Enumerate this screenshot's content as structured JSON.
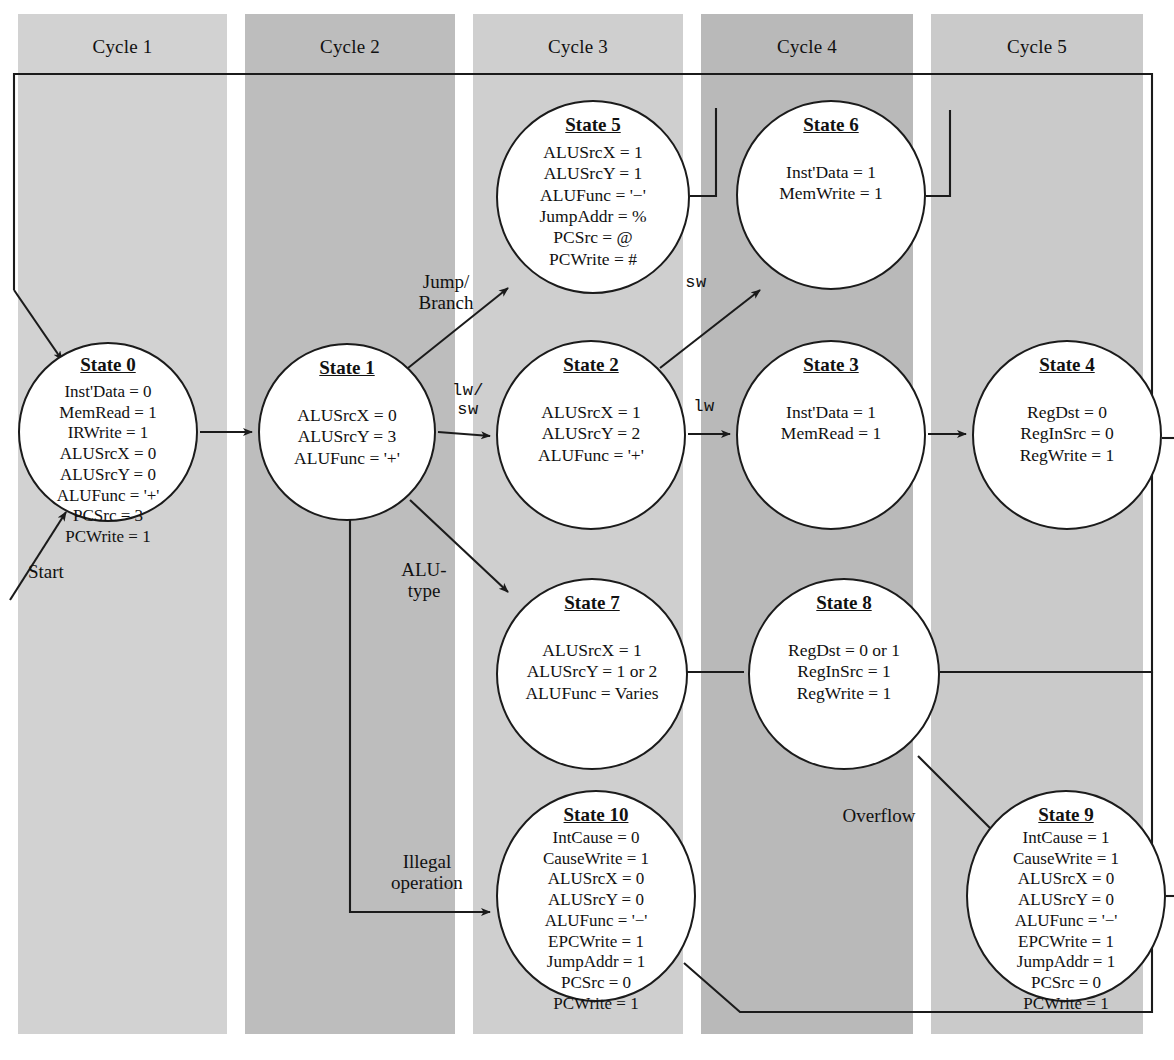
{
  "figure": {
    "kind": "finite-state-machine-diagram"
  },
  "cycles": [
    {
      "label": "Cycle 1",
      "color": "#d2d2d2"
    },
    {
      "label": "Cycle 2",
      "color": "#bdbdbd"
    },
    {
      "label": "Cycle 3",
      "color": "#cfcfcf"
    },
    {
      "label": "Cycle 4",
      "color": "#b9b9b9"
    },
    {
      "label": "Cycle 5",
      "color": "#cacaca"
    }
  ],
  "states": [
    {
      "id": "state-0",
      "title": "State 0",
      "signals": [
        "Inst'Data = 0",
        "MemRead = 1",
        "IRWrite = 1",
        "ALUSrcX = 0",
        "ALUSrcY = 0",
        "ALUFunc = '+'",
        "PCSrc = 3",
        "PCWrite = 1"
      ]
    },
    {
      "id": "state-1",
      "title": "State 1",
      "signals": [
        "ALUSrcX = 0",
        "ALUSrcY = 3",
        "ALUFunc = '+'"
      ]
    },
    {
      "id": "state-5",
      "title": "State 5",
      "signals": [
        "ALUSrcX = 1",
        "ALUSrcY = 1",
        "ALUFunc = '−'",
        "JumpAddr = %",
        "PCSrc = @",
        "PCWrite = #"
      ]
    },
    {
      "id": "state-6",
      "title": "State 6",
      "signals": [
        "Inst'Data = 1",
        "MemWrite = 1"
      ]
    },
    {
      "id": "state-2",
      "title": "State 2",
      "signals": [
        "ALUSrcX = 1",
        "ALUSrcY = 2",
        "ALUFunc = '+'"
      ]
    },
    {
      "id": "state-3",
      "title": "State 3",
      "signals": [
        "Inst'Data = 1",
        "MemRead = 1"
      ]
    },
    {
      "id": "state-4",
      "title": "State 4",
      "signals": [
        "RegDst = 0",
        "RegInSrc = 0",
        "RegWrite = 1"
      ]
    },
    {
      "id": "state-7",
      "title": "State 7",
      "signals": [
        "ALUSrcX = 1",
        "ALUSrcY = 1 or 2",
        "ALUFunc = Varies"
      ]
    },
    {
      "id": "state-8",
      "title": "State 8",
      "signals": [
        "RegDst = 0 or 1",
        "RegInSrc = 1",
        "RegWrite = 1"
      ]
    },
    {
      "id": "state-10",
      "title": "State 10",
      "signals": [
        "IntCause = 0",
        "CauseWrite = 1",
        "ALUSrcX = 0",
        "ALUSrcY = 0",
        "ALUFunc = '−'",
        "EPCWrite = 1",
        "JumpAddr = 1",
        "PCSrc = 0",
        "PCWrite = 1"
      ]
    },
    {
      "id": "state-9",
      "title": "State 9",
      "signals": [
        "IntCause = 1",
        "CauseWrite = 1",
        "ALUSrcX = 0",
        "ALUSrcY = 0",
        "ALUFunc = '−'",
        "EPCWrite = 1",
        "JumpAddr = 1",
        "PCSrc = 0",
        "PCWrite = 1"
      ]
    }
  ],
  "edge_labels": {
    "start": "Start",
    "jump_branch": "Jump/\nBranch",
    "lw_sw": "lw/\nsw",
    "sw": "sw",
    "lw": "lw",
    "alu_type": "ALU-\ntype",
    "illegal_operation": "Illegal\noperation",
    "overflow": "Overflow"
  },
  "transitions": [
    {
      "from": "start",
      "to": "state-0",
      "label": "Start"
    },
    {
      "from": "state-0",
      "to": "state-1",
      "label": ""
    },
    {
      "from": "state-1",
      "to": "state-5",
      "label": "Jump/Branch"
    },
    {
      "from": "state-1",
      "to": "state-2",
      "label": "lw/sw"
    },
    {
      "from": "state-1",
      "to": "state-7",
      "label": "ALU-type"
    },
    {
      "from": "state-1",
      "to": "state-10",
      "label": "Illegal operation"
    },
    {
      "from": "state-2",
      "to": "state-6",
      "label": "sw"
    },
    {
      "from": "state-2",
      "to": "state-3",
      "label": "lw"
    },
    {
      "from": "state-3",
      "to": "state-4",
      "label": ""
    },
    {
      "from": "state-7",
      "to": "state-8",
      "label": ""
    },
    {
      "from": "state-8",
      "to": "state-9",
      "label": "Overflow"
    },
    {
      "from": "state-4",
      "to": "state-0",
      "label": ""
    },
    {
      "from": "state-5",
      "to": "state-0",
      "label": ""
    },
    {
      "from": "state-6",
      "to": "state-0",
      "label": ""
    },
    {
      "from": "state-8",
      "to": "state-0",
      "label": ""
    },
    {
      "from": "state-9",
      "to": "state-0",
      "label": ""
    },
    {
      "from": "state-10",
      "to": "state-0",
      "label": ""
    }
  ],
  "style": {
    "line_color": "#1b1b1b",
    "bubble_fill": "#ffffff",
    "text_color": "#111111",
    "page_background": "#ffffff"
  }
}
